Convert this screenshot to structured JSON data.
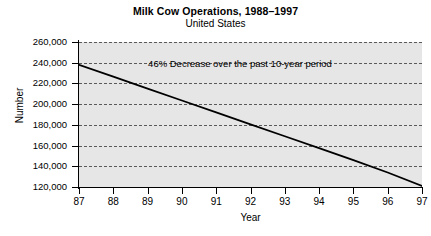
{
  "chart_data": {
    "type": "line",
    "title": "Milk Cow Operations, 1988–1997",
    "subtitle": "United States",
    "xlabel": "Year",
    "ylabel": "Number",
    "grid": true,
    "legend": "none",
    "annotations": [
      {
        "text": "46% Decrease over the past 10-year period",
        "x": 91.5,
        "y": 247000
      }
    ],
    "x": [
      87,
      88,
      89,
      90,
      91,
      92,
      93,
      94,
      95,
      96,
      97
    ],
    "xtick_labels": [
      "87",
      "88",
      "89",
      "90",
      "91",
      "92",
      "93",
      "94",
      "95",
      "96",
      "97"
    ],
    "xlim": [
      87,
      97
    ],
    "ylim": [
      120000,
      260000
    ],
    "ytick_values": [
      120000,
      140000,
      160000,
      180000,
      200000,
      220000,
      240000,
      260000
    ],
    "ytick_labels": [
      "120,000",
      "140,000",
      "160,000",
      "180,000",
      "200,000",
      "220,000",
      "240,000",
      "260,000"
    ],
    "series": [
      {
        "name": "Milk cow operations",
        "color": "#000000",
        "values": [
          238000,
          226500,
          215000,
          203500,
          192000,
          180500,
          169000,
          157500,
          146000,
          134000,
          121000
        ]
      }
    ],
    "plot_background": "#e6e6e6",
    "gridline_color": "#5a5a5a",
    "axis_color": "#000000"
  }
}
